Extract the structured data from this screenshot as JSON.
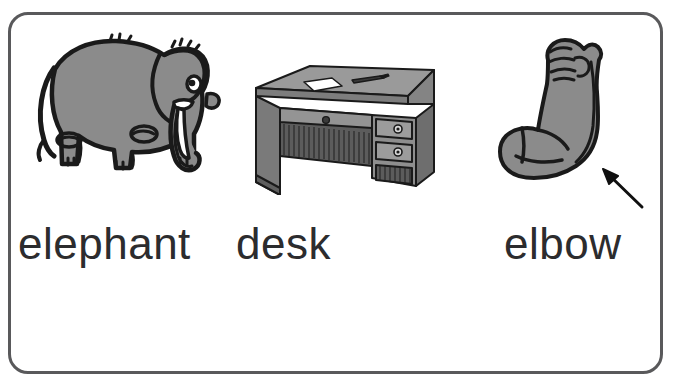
{
  "page": {
    "type": "phonics-picture-word-card",
    "background_color": "#ffffff",
    "frame_color": "#59595b"
  },
  "frame": {
    "name": "rounded-card-border"
  },
  "palette": {
    "outline": "#1a1a1a",
    "fill_gray": "#8b8b8b",
    "fill_gray_dark": "#6f6f6f",
    "fill_gray_light": "#a3a3a3",
    "white": "#ffffff",
    "text": "#2c2c2e",
    "frame": "#59595b"
  },
  "items": [
    {
      "id": "elephant",
      "word": "elephant",
      "picture_alt": "gray cartoon elephant standing, facing right, with tusk, trunk and large ear",
      "has_pointer_arrow": false
    },
    {
      "id": "desk",
      "word": "desk",
      "picture_alt": "gray wooden office desk in three-quarter view with a sheet of paper and a pen on top, a center drawer and two side drawers",
      "has_pointer_arrow": false
    },
    {
      "id": "elbow",
      "word": "elbow",
      "picture_alt": "gray flexed arm with clenched fist showing the bicep, with a black arrow pointing to the elbow",
      "has_pointer_arrow": true
    }
  ],
  "credit": {
    "text": "",
    "visible": false
  }
}
